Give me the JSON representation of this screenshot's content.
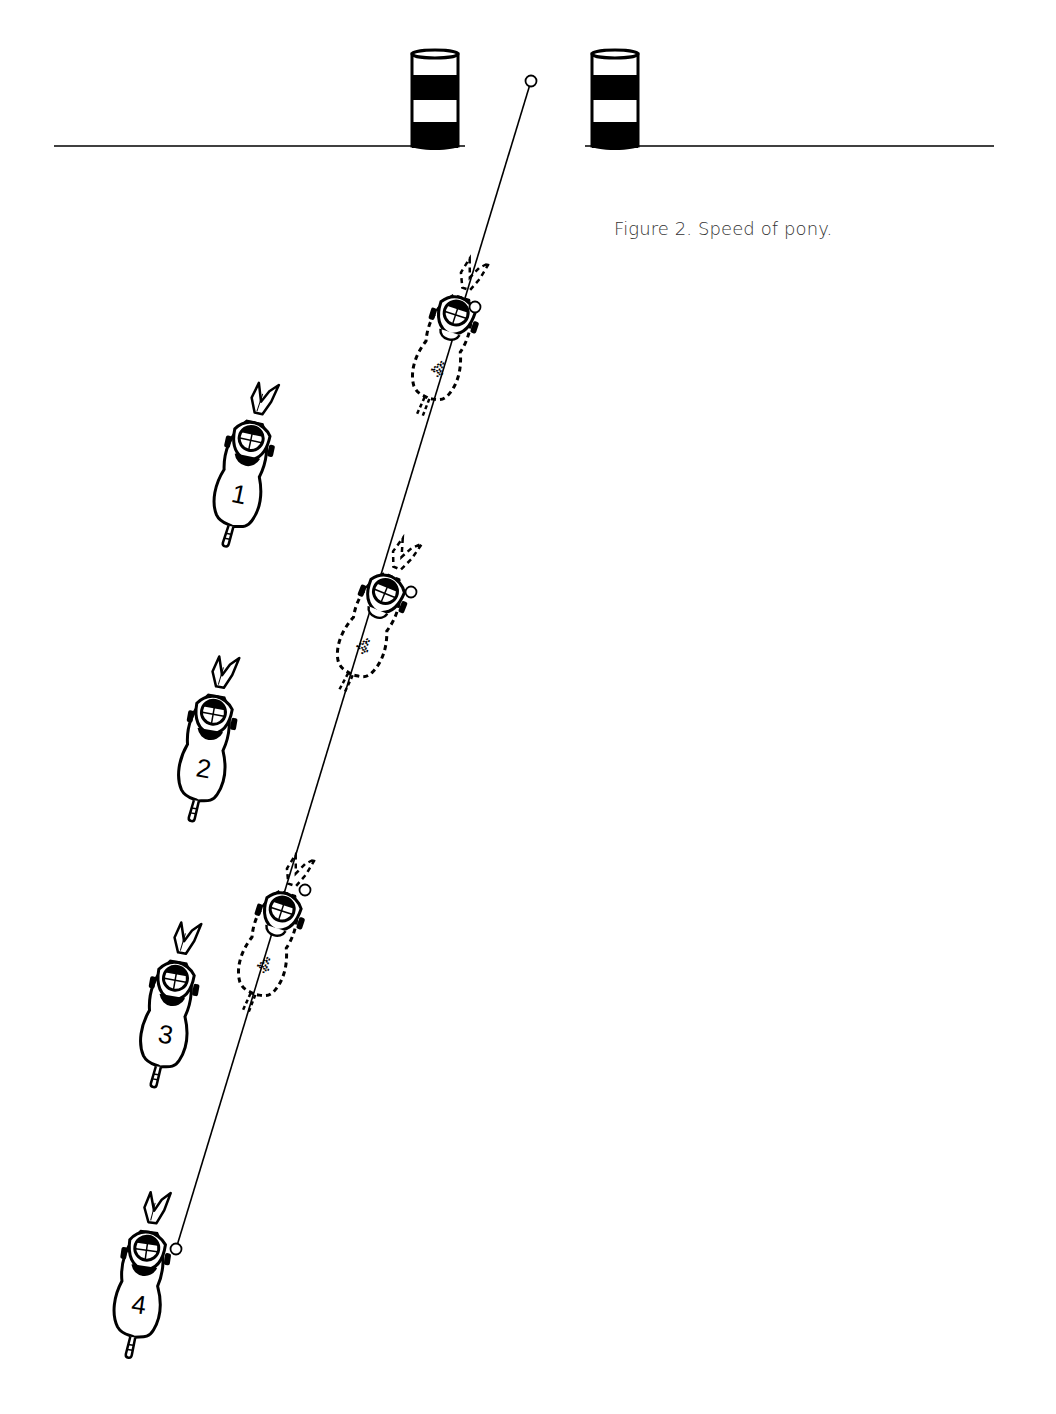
{
  "figure": {
    "caption": "Figure 2. Speed of pony.",
    "ink_color": "#000000",
    "background_color": "#ffffff",
    "caption_color": "#333333"
  },
  "course": {
    "ground_line_left": {
      "x1": 54,
      "x2": 465,
      "y": 146
    },
    "ground_line_right": {
      "x1": 585,
      "x2": 994,
      "y": 146
    },
    "barrels": [
      {
        "name": "left-barrel",
        "x": 412,
        "y": 50,
        "width": 46,
        "height": 100
      },
      {
        "name": "right-barrel",
        "x": 592,
        "y": 50,
        "width": 46,
        "height": 100
      }
    ]
  },
  "path": {
    "from": {
      "x": 176,
      "y": 1249
    },
    "to": {
      "x": 531,
      "y": 81
    },
    "markers": [
      {
        "x": 531,
        "y": 81
      },
      {
        "x": 475,
        "y": 307
      },
      {
        "x": 411,
        "y": 592
      },
      {
        "x": 305,
        "y": 890
      },
      {
        "x": 176,
        "y": 1249
      }
    ]
  },
  "riders": [
    {
      "label": "1",
      "x": 215,
      "y": 378,
      "style": "solid",
      "tilt": 12
    },
    {
      "label": "2",
      "x": 178,
      "y": 652,
      "style": "solid",
      "tilt": 10
    },
    {
      "label": "3",
      "x": 140,
      "y": 918,
      "style": "solid",
      "tilt": 10
    },
    {
      "label": "4",
      "x": 112,
      "y": 1188,
      "style": "solid",
      "tilt": 8
    }
  ],
  "ghost_riders": [
    {
      "label": "4",
      "x": 418,
      "y": 252,
      "style": "dashed",
      "tilt": 18
    },
    {
      "label": "4",
      "x": 346,
      "y": 530,
      "style": "dashed",
      "tilt": 22
    },
    {
      "label": "4",
      "x": 244,
      "y": 848,
      "style": "dashed",
      "tilt": 18
    }
  ]
}
